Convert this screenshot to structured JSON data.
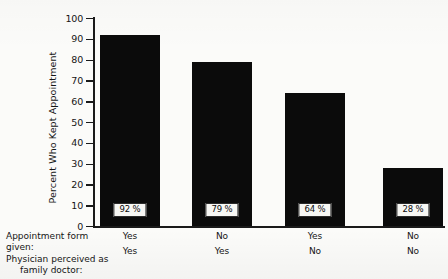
{
  "chart_data": {
    "type": "bar",
    "title": "",
    "xlabel": "",
    "ylabel": "Percent Who Kept Appointment",
    "ylim": [
      0,
      100
    ],
    "ytick_labels": [
      "100",
      "90",
      "80",
      "70",
      "60",
      "50",
      "40",
      "30",
      "20",
      "10",
      "0"
    ],
    "ytick_values": [
      100,
      90,
      80,
      70,
      60,
      50,
      40,
      30,
      20,
      10,
      0
    ],
    "grid": false,
    "legend": "none",
    "bar_color": "#0b0b0b",
    "categories": [
      "Yes / Yes",
      "No / Yes",
      "Yes / No",
      "No / No"
    ],
    "values": [
      92,
      79,
      64,
      28
    ],
    "data_labels": [
      "92 %",
      "79 %",
      "64 %",
      "28 %"
    ],
    "group_headers": [
      "Appointment form given:",
      "Physician perceived as family doctor:"
    ],
    "group_rows": [
      {
        "label_line1": "Appointment form given:",
        "values": [
          "Yes",
          "No",
          "Yes",
          "No"
        ]
      },
      {
        "label_line1": "Physician perceived as",
        "label_line2": "family doctor:",
        "values": [
          "Yes",
          "Yes",
          "No",
          "No"
        ]
      }
    ]
  },
  "axis": {
    "y_title": "Percent Who Kept Appointment"
  },
  "stub": {
    "line1": "Appointment form given:",
    "line2": "Physician perceived as",
    "line3": "family doctor:"
  }
}
